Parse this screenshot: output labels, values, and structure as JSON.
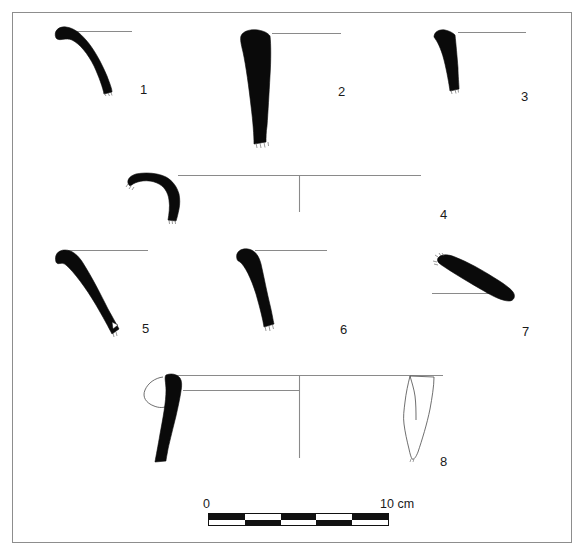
{
  "figure": {
    "type": "archaeological-pottery-profile-plate",
    "background_color": "#ffffff",
    "ink_color": "#111111",
    "frame_color": "#8d8d8d",
    "line_color": "#8a8a8a"
  },
  "items": [
    {
      "number": "1",
      "label_x": 140,
      "label_y": 83,
      "description": "everted rim sherd, thickened rounded lip, curving wall",
      "rim_line": {
        "x1": 64,
        "y1": 31,
        "x2": 132,
        "y2": 31
      }
    },
    {
      "number": "2",
      "label_x": 338,
      "label_y": 85,
      "description": "tall near-vertical thick wall sherd, tapering base",
      "rim_line": {
        "x1": 272,
        "y1": 33,
        "x2": 341,
        "y2": 33
      }
    },
    {
      "number": "3",
      "label_x": 521,
      "label_y": 90,
      "description": "short flaring rim sherd",
      "rim_line": {
        "x1": 458,
        "y1": 32,
        "x2": 526,
        "y2": 32
      }
    },
    {
      "number": "4",
      "label_x": 440,
      "label_y": 208,
      "description": "hooked everted rim with long rim line and vertical centre axis",
      "rim_line": {
        "x1": 178,
        "y1": 175,
        "x2": 421,
        "y2": 175
      },
      "axis_line": {
        "x1": 299,
        "y1": 175,
        "x2": 299,
        "y2": 212
      }
    },
    {
      "number": "5",
      "label_x": 142,
      "label_y": 322,
      "description": "oblique elongated tapering wall sherd",
      "rim_line": {
        "x1": 64,
        "y1": 250,
        "x2": 148,
        "y2": 250
      }
    },
    {
      "number": "6",
      "label_x": 340,
      "label_y": 323,
      "description": "small curved rim sherd with rounded lip",
      "rim_line": {
        "x1": 255,
        "y1": 250,
        "x2": 327,
        "y2": 250
      }
    },
    {
      "number": "7",
      "label_x": 522,
      "label_y": 325,
      "description": "diagonal elongated sherd sloping down to the right",
      "rim_line": {
        "x1": 432,
        "y1": 293,
        "x2": 513,
        "y2": 293
      }
    },
    {
      "number": "8",
      "label_x": 440,
      "label_y": 455,
      "description": "vessel rim profile with solid section at left, outlined lug handle, long rim line, vertical centre axis, and exterior outline view at right",
      "rim_line": {
        "x1": 171,
        "y1": 375,
        "x2": 443,
        "y2": 375
      },
      "inner_line": {
        "x1": 183,
        "y1": 390,
        "x2": 299,
        "y2": 390
      },
      "axis_line": {
        "x1": 299,
        "y1": 375,
        "x2": 299,
        "y2": 458
      }
    }
  ],
  "scale": {
    "start_label": "0",
    "end_label": "10 cm",
    "unit": "cm",
    "length_cm": 10,
    "segments": 5,
    "bar_left_px": 208,
    "bar_right_px": 389,
    "start_label_x": 203,
    "start_label_y": 498,
    "end_label_x": 380,
    "end_label_y": 498,
    "top_row_pattern": [
      "on",
      "off",
      "on",
      "off",
      "on"
    ],
    "bottom_row_pattern": [
      "off",
      "on",
      "off",
      "on",
      "off"
    ]
  }
}
